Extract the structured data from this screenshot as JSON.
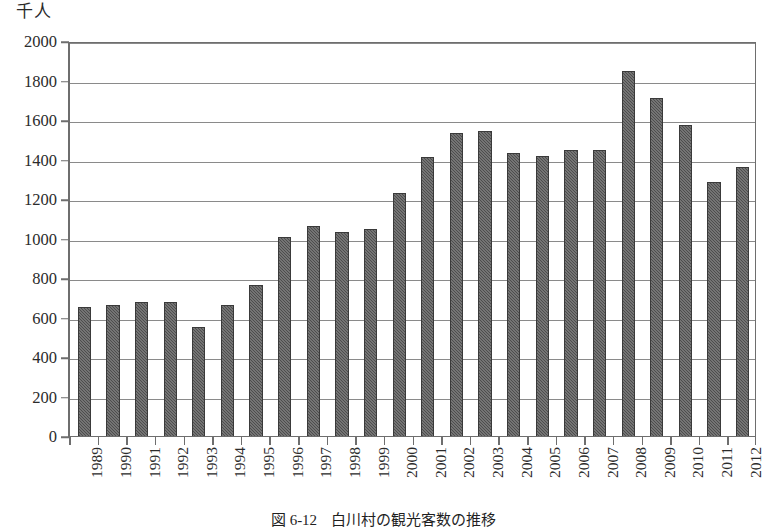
{
  "figure": {
    "caption_number": "図 6-12",
    "caption_title": "白川村の観光客数の推移"
  },
  "chart_data": {
    "type": "bar",
    "title": "白川村の観光客数の推移",
    "xlabel": "",
    "ylabel": "千人",
    "ylim": [
      0,
      2000
    ],
    "ytick_step": 200,
    "grid": true,
    "legend": "none",
    "bar_color": "#4d4d4d",
    "axis_color": "#6e6e6e",
    "ytick_labels": [
      "2000",
      "1800",
      "1600",
      "1400",
      "1200",
      "1000",
      "800",
      "600",
      "400",
      "200",
      "0"
    ],
    "categories": [
      "1989",
      "1990",
      "1991",
      "1992",
      "1993",
      "1994",
      "1995",
      "1996",
      "1997",
      "1998",
      "1999",
      "2000",
      "2001",
      "2002",
      "2003",
      "2004",
      "2005",
      "2006",
      "2007",
      "2008",
      "2009",
      "2010",
      "2011",
      "2012"
    ],
    "values": [
      655,
      665,
      680,
      680,
      550,
      665,
      765,
      1010,
      1065,
      1035,
      1050,
      1230,
      1415,
      1535,
      1545,
      1435,
      1420,
      1450,
      1450,
      1850,
      1710,
      1575,
      1285,
      1360
    ]
  }
}
